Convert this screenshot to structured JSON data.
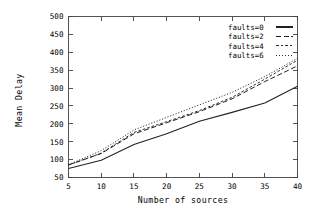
{
  "chart_data": {
    "type": "line",
    "title": "",
    "xlabel": "Number of sources",
    "ylabel": "Mean Delay",
    "xlim": [
      5,
      40
    ],
    "ylim": [
      50,
      500
    ],
    "xticks": [
      5,
      10,
      15,
      20,
      25,
      30,
      35,
      40
    ],
    "xtick_labels": [
      "5",
      "10",
      "15",
      "20",
      "25",
      "30",
      "35",
      "40"
    ],
    "yticks": [
      50,
      100,
      150,
      200,
      250,
      300,
      350,
      400,
      450,
      500
    ],
    "ytick_labels": [
      "50",
      "100",
      "150",
      "200",
      "250",
      "300",
      "350",
      "400",
      "450",
      "500"
    ],
    "grid": false,
    "legend_position": "top-right",
    "x": [
      5,
      10,
      15,
      20,
      25,
      30,
      35,
      40
    ],
    "series": [
      {
        "name": "faults=0",
        "style": "solid",
        "values": [
          75,
          98,
          142,
          172,
          207,
          232,
          258,
          305
        ]
      },
      {
        "name": "faults=2",
        "style": "dashed",
        "values": [
          85,
          117,
          172,
          203,
          234,
          270,
          318,
          362
        ]
      },
      {
        "name": "faults=4",
        "style": "dotted",
        "values": [
          85,
          118,
          176,
          206,
          237,
          274,
          325,
          378
        ]
      },
      {
        "name": "faults=6",
        "style": "fine-dotted",
        "values": [
          86,
          125,
          183,
          218,
          253,
          288,
          332,
          383
        ]
      }
    ]
  },
  "legend": {
    "entries": [
      {
        "label": "faults=0"
      },
      {
        "label": "faults=2"
      },
      {
        "label": "faults=4"
      },
      {
        "label": "faults=6"
      }
    ]
  },
  "axes": {
    "x_title": "Number of sources",
    "y_title": "Mean Delay"
  }
}
